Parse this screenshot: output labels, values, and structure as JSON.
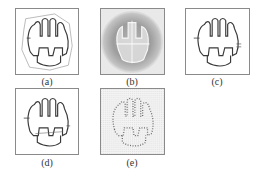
{
  "figure": {
    "panels": [
      {
        "id": "a",
        "label": "(a)",
        "description": "contour with polygonal outer boundary"
      },
      {
        "id": "b",
        "label": "(b)",
        "description": "textured / gradient field image"
      },
      {
        "id": "c",
        "label": "(c)",
        "description": "extracted contour"
      },
      {
        "id": "d",
        "label": "(d)",
        "description": "extracted contour variant"
      },
      {
        "id": "e",
        "label": "(e)",
        "description": "dotted sampled contour"
      }
    ]
  },
  "colors": {
    "border": "#8a8a8a",
    "contour": "#3a3a3a",
    "outer_polygon": "#a8a8a8",
    "texture_bg": "#e9e9e9",
    "caption": "#333333"
  }
}
